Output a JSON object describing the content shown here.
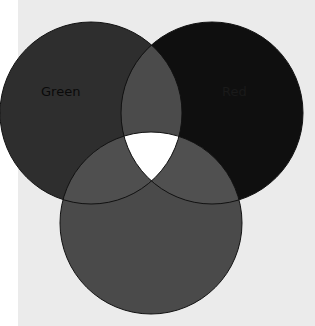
{
  "diagram": {
    "type": "venn",
    "sets": [
      {
        "name": "Green",
        "label": "Green",
        "cx": 91,
        "cy": 113,
        "r": 91,
        "fill": "#2e2e2e"
      },
      {
        "name": "Red",
        "label": "Red",
        "cx": 212,
        "cy": 113,
        "r": 91,
        "fill": "#0f0f0f"
      },
      {
        "name": "Blue",
        "label": "",
        "cx": 151,
        "cy": 223,
        "r": 91,
        "fill": "#4a4a4a"
      }
    ],
    "overlap_fill": "#4d4d4d",
    "center_fill": "#ffffff",
    "outline_color": "#111111",
    "page_background": "#ebebeb"
  }
}
